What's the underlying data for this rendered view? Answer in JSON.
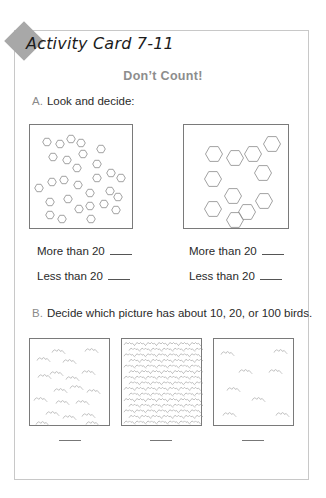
{
  "header": {
    "title": "Activity Card 7-11",
    "subtitle": "Don’t Count!"
  },
  "sectionA": {
    "letter": "A.",
    "instruction": "Look and decide:",
    "pictures": [
      {
        "shape": "small-hexagons",
        "count": 29
      },
      {
        "shape": "large-hexagons",
        "count": 11
      }
    ],
    "questions": [
      {
        "more": "More than 20",
        "less": "Less than 20"
      },
      {
        "more": "More than 20",
        "less": "Less than 20"
      }
    ]
  },
  "sectionB": {
    "letter": "B.",
    "instruction": "Decide which picture has about 10, 20, or 100 birds.",
    "pictures": [
      {
        "content": "birds-medium",
        "approx_count": 20
      },
      {
        "content": "birds-dense",
        "approx_count": 100
      },
      {
        "content": "birds-sparse",
        "approx_count": 8
      }
    ],
    "answer_blanks": 3
  },
  "colors": {
    "border": "#c8c8c8",
    "diamond": "#a8a8a8",
    "subtitle": "#8d8d8d",
    "text": "#2a2a2a",
    "shape_stroke": "#8a8a8a"
  }
}
